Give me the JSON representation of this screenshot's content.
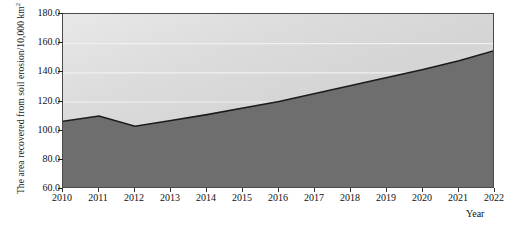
{
  "chart_data": {
    "type": "area",
    "title": "",
    "xlabel": "Year",
    "ylabel": "The area recovered from soil erosion/10,000 km",
    "ylabel_superscript": "2",
    "categories": [
      "2010",
      "2011",
      "2012",
      "2013",
      "2014",
      "2015",
      "2016",
      "2017",
      "2018",
      "2019",
      "2020",
      "2021",
      "2022"
    ],
    "values": [
      106.5,
      110.0,
      103.0,
      107.0,
      111.0,
      115.5,
      120.0,
      125.5,
      131.0,
      136.5,
      142.0,
      148.0,
      155.0
    ],
    "ylim": [
      60.0,
      180.0
    ],
    "ytick_labels": [
      "180.0",
      "160.0",
      "140.0",
      "120.0",
      "100.0",
      "80.0",
      "60.0"
    ],
    "ytick_values": [
      180.0,
      160.0,
      140.0,
      120.0,
      100.0,
      80.0,
      60.0
    ],
    "grid": true,
    "legend": "none",
    "colors": {
      "area_fill": "#6e6e6e",
      "line": "#1c1c1c",
      "plot_background_light": "#f6f6f6",
      "plot_background_dark": "#d6d6d6",
      "gridline": "#f0f0f0",
      "axis": "#4a4a4a",
      "text": "#111111"
    }
  }
}
